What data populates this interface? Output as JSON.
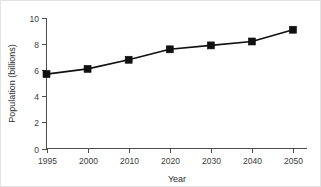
{
  "chart_data": {
    "type": "line",
    "title": "",
    "subtitle": "",
    "xlabel": "Year",
    "ylabel": "Population (billions)",
    "categories": [
      "1995",
      "2000",
      "2010",
      "2020",
      "2030",
      "2040",
      "2050"
    ],
    "values": [
      5.7,
      6.1,
      6.8,
      7.6,
      7.9,
      8.2,
      9.1
    ],
    "series": [
      {
        "name": "World population",
        "values": [
          5.7,
          6.1,
          6.8,
          7.6,
          7.9,
          8.2,
          9.1
        ]
      }
    ],
    "ylim": [
      0,
      10
    ],
    "yticks": [
      "0",
      "2",
      "4",
      "6",
      "8",
      "10"
    ],
    "ytick_values": [
      0,
      2,
      4,
      6,
      8,
      10
    ],
    "xticks": [
      "1995",
      "2000",
      "2010",
      "2020",
      "2030",
      "2040",
      "2050"
    ],
    "grid": false,
    "legend": false,
    "legend_position": "none",
    "marker": "square",
    "line_color": "#101010",
    "marker_color": "#101010",
    "axis_color": "#4d4d4d",
    "background_color": "#ffffff"
  }
}
